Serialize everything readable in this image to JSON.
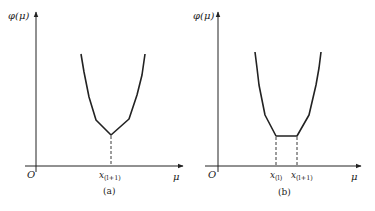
{
  "figure": {
    "stroke_color": "#222222",
    "background": "#ffffff",
    "panels": [
      {
        "id": "a",
        "caption": "(a)",
        "y_axis_label": "φ(μ)",
        "x_axis_label": "μ",
        "origin_label": "O",
        "x_ticks": [
          {
            "base": "x",
            "sub": "(l+1)"
          }
        ],
        "curve_description": "convex piecewise curve with single minimum (kink) at x(l+1)"
      },
      {
        "id": "b",
        "caption": "(b)",
        "y_axis_label": "φ(μ)",
        "x_axis_label": "μ",
        "origin_label": "O",
        "x_ticks": [
          {
            "base": "x",
            "sub": "(l)"
          },
          {
            "base": "x",
            "sub": "(l+1)"
          }
        ],
        "curve_description": "convex piecewise curve with flat minimum segment between x(l) and x(l+1)"
      }
    ]
  }
}
